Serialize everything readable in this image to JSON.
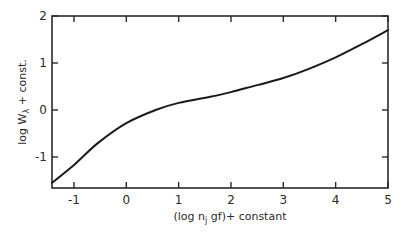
{
  "chart_data": {
    "type": "line",
    "title": "",
    "xlabel": "(log n_j gf) + constant",
    "xlabel_parts": {
      "pre": "(log  n",
      "sub": "j",
      "post": " gf)+ constant"
    },
    "ylabel": "log W_λ + const.",
    "ylabel_parts": {
      "pre": "log  W",
      "sub": "λ",
      "post": " + const."
    },
    "xlim": [
      -1.42,
      5.0
    ],
    "ylim": [
      -1.66,
      2.0
    ],
    "xticks": [
      -1,
      0,
      1,
      2,
      3,
      4,
      5
    ],
    "xtick_labels": [
      "-1",
      "0",
      "1",
      "2",
      "3",
      "4",
      "5"
    ],
    "yticks": [
      -1,
      0,
      1,
      2
    ],
    "ytick_labels": [
      "-1",
      "0",
      "1",
      "2"
    ],
    "grid": false,
    "legend": null,
    "series": [
      {
        "name": "curve of growth",
        "x": [
          -1.42,
          -1.0,
          -0.54,
          0.0,
          0.56,
          1.0,
          1.6,
          2.0,
          2.5,
          3.0,
          3.5,
          4.0,
          4.5,
          5.0
        ],
        "y": [
          -1.55,
          -1.17,
          -0.7,
          -0.28,
          0.0,
          0.15,
          0.28,
          0.38,
          0.53,
          0.68,
          0.88,
          1.12,
          1.4,
          1.7
        ]
      }
    ],
    "colors": {
      "line": "#1a1a1a",
      "axis": "#2a2a2a",
      "background": "#ffffff"
    }
  }
}
